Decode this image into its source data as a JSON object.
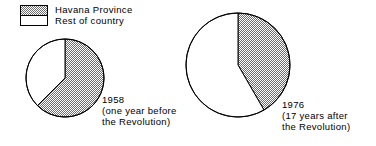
{
  "figure": {
    "width": 376,
    "height": 146,
    "background": "#ffffff",
    "ink_color": "#000000",
    "hatch_color": "#6e6e6e"
  },
  "legend": {
    "items": [
      {
        "label": "Havana Province",
        "swatch": "hatched-gray"
      },
      {
        "label": "Rest of country",
        "swatch": "white"
      }
    ]
  },
  "captions": {
    "first": {
      "year": "1958",
      "note_line1": "(one year before",
      "note_line2": "the Revolution)"
    },
    "second": {
      "year": "1976",
      "note_line1": "(17 years after",
      "note_line2": "the Revolution)"
    }
  },
  "chart_data": {
    "type": "pie",
    "title": "",
    "xlabel": "",
    "ylabel": "",
    "legend_position": "top-left",
    "grid": false,
    "series_names": [
      "Havana Province",
      "Rest of country"
    ],
    "charts": [
      {
        "name": "1958",
        "caption": "1958 (one year before the Revolution)",
        "start_angle_deg": 0,
        "direction": "clockwise",
        "center_x": 65,
        "center_y": 78,
        "radius": 39,
        "slices": [
          {
            "label": "Havana Province",
            "value": 62.5,
            "angle_deg": 225,
            "fill": "hatched-gray"
          },
          {
            "label": "Rest of country",
            "value": 37.5,
            "angle_deg": 135,
            "fill": "white"
          }
        ]
      },
      {
        "name": "1976",
        "caption": "1976 (17 years after the Revolution)",
        "start_angle_deg": 0,
        "direction": "clockwise",
        "center_x": 238,
        "center_y": 65,
        "radius": 52,
        "slices": [
          {
            "label": "Havana Province",
            "value": 41.7,
            "angle_deg": 150,
            "fill": "hatched-gray"
          },
          {
            "label": "Rest of country",
            "value": 58.3,
            "angle_deg": 210,
            "fill": "white"
          }
        ]
      }
    ]
  }
}
